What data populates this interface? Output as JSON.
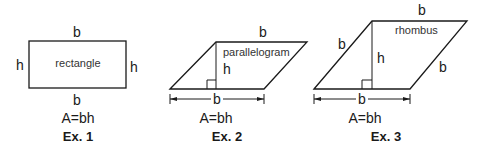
{
  "examples": [
    {
      "name": "rectangle",
      "shape_label": "rectangle",
      "top_label": "b",
      "bottom_label": "b",
      "left_label": "h",
      "right_label": "h",
      "formula": "A=bh",
      "caption": "Ex. 1"
    },
    {
      "name": "parallelogram",
      "shape_label": "parallelogram",
      "top_label": "b",
      "height_label": "h",
      "base_dimension_label": "b",
      "formula": "A=bh",
      "caption": "Ex. 2"
    },
    {
      "name": "rhombus",
      "shape_label": "rhombus",
      "top_label": "b",
      "left_side_label": "b",
      "right_side_label": "b",
      "height_label": "h",
      "base_dimension_label": "b",
      "formula": "A=bh",
      "caption": "Ex. 3"
    }
  ]
}
